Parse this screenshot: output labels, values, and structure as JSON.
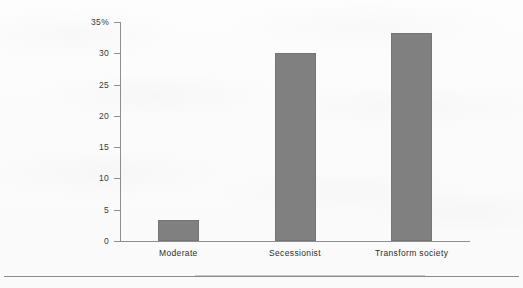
{
  "chart_data": {
    "type": "bar",
    "title": "",
    "subtitle": "",
    "xlabel": "",
    "ylabel": "",
    "categories": [
      "Moderate",
      "Secessionist",
      "Transform society"
    ],
    "values": [
      3.4,
      30.1,
      33.3
    ],
    "series": [
      {
        "name": "Share of respondents",
        "values": [
          3.4,
          30.1,
          33.3
        ]
      }
    ],
    "ylim": [
      0,
      35
    ],
    "y_ticks": [
      0,
      5,
      10,
      15,
      20,
      25,
      30,
      35
    ],
    "y_tick_labels": [
      "0",
      "5",
      "10",
      "15",
      "20",
      "25",
      "30",
      "35%"
    ],
    "grid": false,
    "legend": "none",
    "orientation": "vertical",
    "bar_color": "#808080",
    "axis_color": "#8e8e8e",
    "background_color": "#fbfbfb",
    "text_color": "#2e2e2e",
    "units": "percent"
  },
  "footer": {
    "rule": ""
  }
}
